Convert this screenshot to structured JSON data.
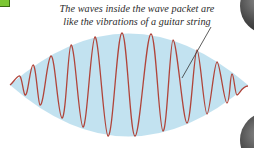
{
  "caption": {
    "line1": "The waves inside the wave packet are",
    "line2": "like the vibrations of a guitar string"
  },
  "figure": {
    "subject": "wave packet",
    "envelope_color": "#bfe0ef",
    "wave_color": "#b0443a",
    "pointer_color": "#333333",
    "tab_color": "#7cc633",
    "orb_color": "#3a3a3a"
  },
  "icons": {
    "tab": "green-square-tab",
    "orbs": "dark-sphere-decoration"
  }
}
